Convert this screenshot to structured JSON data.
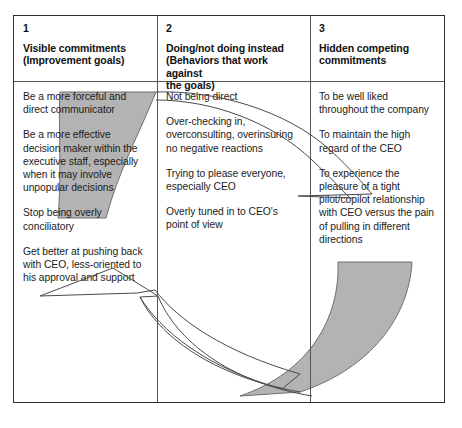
{
  "diagram": {
    "title_hidden": "Immunity to change map",
    "colors": {
      "arc_fill": "#b3b3b3",
      "arc_stroke": "#6f6f6f",
      "arrow_stroke": "#4a4a4a",
      "table_border": "#2e2e2e",
      "text": "#1b1b1b",
      "background": "#ffffff"
    },
    "columns": [
      {
        "number": "1",
        "title": "Visible commitments\n(Improvement goals)",
        "title_lines": [
          "Visible commitments",
          "(Improvement goals)"
        ],
        "entries": [
          "Be a more forceful and direct communicator",
          "Be a more effective decision maker within the executive staff, especially when it may involve unpopular decisions",
          "Stop being overly conciliatory",
          "Get better at pushing back with CEO, less-oriented to his approval and support"
        ]
      },
      {
        "number": "2",
        "title": "Doing/not doing instead\n(Behaviors that work against the goals)",
        "title_lines": [
          "Doing/not doing instead",
          "(Behaviors that work against",
          "the goals)"
        ],
        "entries": [
          "Not being direct",
          "Over-checking in, overconsulting, overinsuring no negative reactions",
          "Trying to please everyone, especially CEO",
          "Overly tuned in to CEO's point of view"
        ]
      },
      {
        "number": "3",
        "title": "Hidden competing commitments",
        "title_lines": [
          "Hidden competing",
          "commitments"
        ],
        "entries": [
          "To be well liked throughout the company",
          "To maintain the high regard of the CEO",
          "To experience the pleasure of a tight pilot/copilot relationship with CEO versus the pain of pulling in different directions"
        ]
      }
    ],
    "shapes": {
      "upper_left_gray_arc": "gray-arc-upper-left",
      "lower_right_gray_arc": "gray-arc-lower-right",
      "thin_arc_top": "thin-arc-top-right",
      "outlined_sweep_arrow": "outlined-arrow-lower-left"
    }
  }
}
